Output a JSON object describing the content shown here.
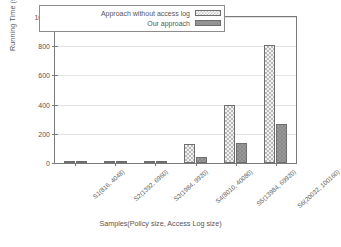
{
  "chart_data": {
    "type": "bar",
    "title": "",
    "xlabel": "Samples(Policy size, Access Log size)",
    "ylabel": "Running Time (sec)",
    "categories": [
      "S1(816, 4048)",
      "S2(1392, 6960)",
      "S3(1984, 9920)",
      "S4(8010, 40080)",
      "S5(13984, 69920)",
      "S6(20032, 100160)"
    ],
    "series": [
      {
        "name": "Approach without access log",
        "values": [
          1,
          2,
          7,
          133,
          398,
          805
        ]
      },
      {
        "name": "Our approach",
        "values": [
          0.5,
          1,
          2,
          40,
          140,
          265
        ]
      }
    ],
    "ylim": [
      0,
      1000
    ],
    "yticks": [
      0,
      200,
      400,
      600,
      800,
      1000
    ],
    "ytick_labels": [
      "0",
      "200",
      "400",
      "600",
      "800",
      "1000"
    ],
    "grid": true,
    "legend_position": "top-center-inside",
    "colors": {
      "series0_fill": "#f2f2f2",
      "series0_hatch": "#b9b9b9",
      "series1_fill": "#989898",
      "axis": "#7a7a7a",
      "grid": "#e2e2e2",
      "text": "#555555"
    }
  }
}
